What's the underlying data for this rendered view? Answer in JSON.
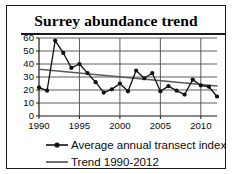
{
  "chart_data": {
    "type": "line",
    "title": "Surrey abundance trend",
    "xlabel": "",
    "ylabel": "",
    "xlim": [
      1990,
      2012
    ],
    "ylim": [
      0,
      60
    ],
    "ytick_values": [
      0,
      10,
      20,
      30,
      40,
      50,
      60
    ],
    "ytick_labels": [
      "0",
      "10",
      "20",
      "30",
      "40",
      "50",
      "60"
    ],
    "xtick_values": [
      1990,
      1995,
      2000,
      2005,
      2010
    ],
    "xtick_labels": [
      "1990",
      "1995",
      "2000",
      "2005",
      "2010"
    ],
    "grid": "horizontal-and-major-vertical",
    "legend_position": "below",
    "x": [
      1990,
      1991,
      1992,
      1993,
      1994,
      1995,
      1996,
      1997,
      1998,
      1999,
      2000,
      2001,
      2002,
      2003,
      2004,
      2005,
      2006,
      2007,
      2008,
      2009,
      2010,
      2011,
      2012
    ],
    "series": [
      {
        "name": "Average annual transect index",
        "marker": "filled-circle",
        "color": "#111111",
        "values": [
          22,
          19.5,
          58,
          48.5,
          37,
          40,
          33,
          26,
          18,
          20.5,
          25,
          19,
          35,
          29,
          33,
          19,
          23,
          19.5,
          16.5,
          28,
          23.5,
          22.5,
          15
        ]
      },
      {
        "name": "Trend 1990-2012",
        "marker": "none",
        "color": "#5a5a5a",
        "endpoints": [
          36,
          23
        ],
        "values": [
          36,
          35.4,
          34.8,
          34.2,
          33.5,
          32.9,
          32.3,
          31.7,
          31.1,
          30.5,
          29.8,
          29.2,
          28.6,
          28,
          27.4,
          26.8,
          26.1,
          25.5,
          24.9,
          24.3,
          23.7,
          23.1,
          22.5
        ]
      }
    ]
  },
  "legend": {
    "items": [
      {
        "label": "Average annual transect index",
        "key": "line-with-marker"
      },
      {
        "label": "Trend 1990-2012",
        "key": "plain-line"
      }
    ]
  }
}
